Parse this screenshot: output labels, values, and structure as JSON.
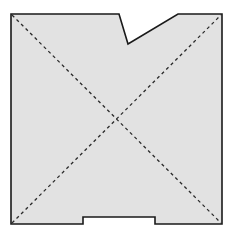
{
  "figure": {
    "title": "",
    "caption": "",
    "background_color": "#ffffff",
    "shape": {
      "name": "notched-square-plate",
      "fill_color": "#e2e2e2",
      "outline_color": "#1a1a1a",
      "outline_width": 1.6,
      "bounds": {
        "left": 11,
        "top": 14,
        "right": 222,
        "bottom": 224
      },
      "outline_points": "11,14 119,14 128,44 178,14 222,14 222,224 155,224 155,217 83,217 83,224 11,224"
    },
    "features": [
      {
        "name": "top-notch",
        "type": "v-notch",
        "vertical_edge_x": 119,
        "vertex_x": 128,
        "vertex_y": 44,
        "ramp_end_x": 178,
        "ramp_end_y": 14
      },
      {
        "name": "bottom-tab",
        "type": "rectangular-tab",
        "left": 83,
        "right": 155,
        "shoulder_y": 217,
        "bottom_y": 224
      }
    ],
    "diagonals": {
      "name": "construction-diagonals",
      "stroke_color": "#2b2b2b",
      "stroke_width": 1.3,
      "dash_pattern": "3.2 3.2",
      "center_x": 117,
      "center_y": 119,
      "lines": [
        {
          "name": "diagonal-tl-br",
          "x1": 12,
          "y1": 15,
          "x2": 221,
          "y2": 223
        },
        {
          "name": "diagonal-bl-tr",
          "x1": 12,
          "y1": 223,
          "x2": 221,
          "y2": 15
        }
      ]
    }
  }
}
